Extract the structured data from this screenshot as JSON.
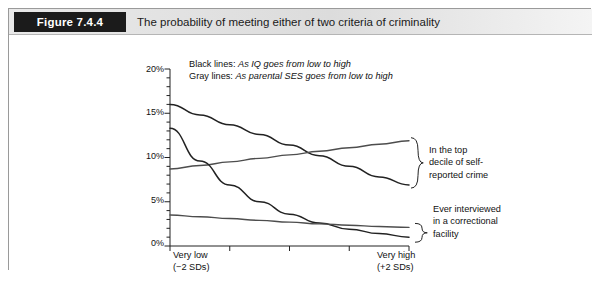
{
  "figure": {
    "tag": "Figure 7.4.4",
    "title": "The probability of meeting either of two criteria of criminality"
  },
  "chart_data": {
    "type": "line",
    "title": "The probability of meeting either of two criteria of criminality",
    "xlabel": "",
    "ylabel": "",
    "xlim": [
      -2,
      2
    ],
    "ylim": [
      0,
      20
    ],
    "grid": false,
    "legend_position": "top-inside",
    "legend": [
      {
        "key": "Black lines:",
        "desc": "As IQ goes from low to high"
      },
      {
        "key": "Gray lines:",
        "desc": "As parental SES goes from low to high"
      }
    ],
    "ytick_labels": [
      "0%",
      "5%",
      "10%",
      "15%",
      "20%"
    ],
    "ytick_values": [
      0,
      5,
      10,
      15,
      20
    ],
    "yminor_step": 1,
    "xtick_values": [
      -2,
      -1,
      0,
      1,
      2
    ],
    "xtick_labels_shown": [
      {
        "at": -2,
        "line1": "Very low",
        "line2": "(−2 SDs)"
      },
      {
        "at": 2,
        "line1": "Very high",
        "line2": "(+2 SDs)"
      }
    ],
    "annotations": [
      {
        "name": "top-decile-brace",
        "text": "In the top decile of self-reported crime",
        "lines": [
          "In the top",
          "decile of self-",
          "reported crime"
        ]
      },
      {
        "name": "correctional-brace",
        "text": "Ever interviewed in a correctional facility",
        "lines": [
          "Ever interviewed",
          "in a correctional",
          "facility"
        ]
      }
    ],
    "x": [
      -2,
      -1.5,
      -1,
      -0.5,
      0,
      0.5,
      1,
      1.5,
      2
    ],
    "series": [
      {
        "name": "Self-reported crime, by IQ",
        "color": "#222222",
        "style": "black",
        "group": "top decile of self-reported crime",
        "values": [
          16.0,
          14.8,
          13.7,
          12.6,
          11.4,
          10.2,
          9.0,
          7.8,
          6.9
        ]
      },
      {
        "name": "Self-reported crime, by parental SES",
        "color": "#4d4d4d",
        "style": "gray",
        "group": "top decile of self-reported crime",
        "values": [
          8.7,
          9.1,
          9.5,
          9.9,
          10.3,
          10.7,
          11.1,
          11.5,
          11.9
        ]
      },
      {
        "name": "Correctional facility, by IQ",
        "color": "#222222",
        "style": "black",
        "group": "ever interviewed in a correctional facility",
        "values": [
          13.3,
          9.6,
          6.9,
          5.0,
          3.6,
          2.6,
          1.9,
          1.4,
          1.0
        ]
      },
      {
        "name": "Correctional facility, by parental SES",
        "color": "#4d4d4d",
        "style": "gray",
        "group": "ever interviewed in a correctional facility",
        "values": [
          3.5,
          3.3,
          3.1,
          2.9,
          2.7,
          2.5,
          2.35,
          2.2,
          2.1
        ]
      }
    ]
  }
}
